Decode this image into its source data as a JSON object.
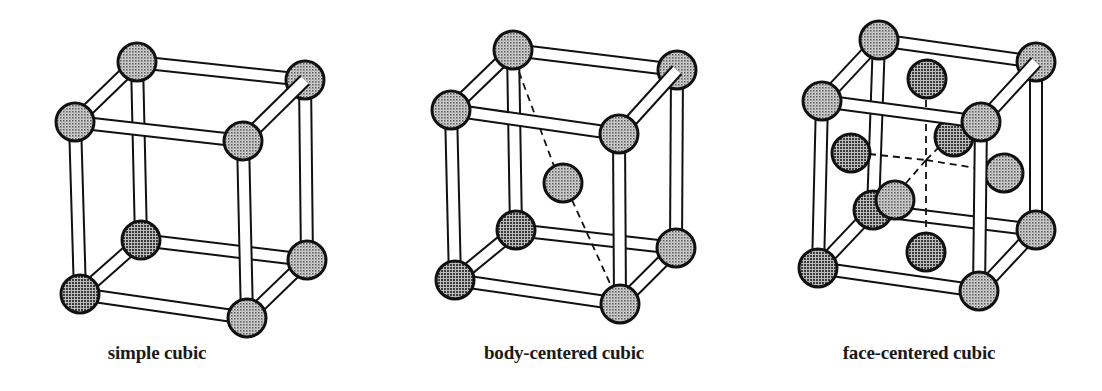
{
  "figure": {
    "colors": {
      "background": "#ffffff",
      "outline": "#111111",
      "atom_fill": "#bdbdbd",
      "atom_dot": "#444444",
      "rod_fill": "#ffffff"
    },
    "cells": [
      {
        "id": "simple-cubic",
        "label": "simple cubic",
        "label_x": 157,
        "atom_radius": 19,
        "rod_width": 11,
        "corners": {
          "TBL": [
            137,
            62
          ],
          "TBR": [
            305,
            80
          ],
          "TFL": [
            75,
            122
          ],
          "TFR": [
            243,
            141
          ],
          "BBL": [
            141,
            240
          ],
          "BBR": [
            307,
            260
          ],
          "BFL": [
            80,
            294
          ],
          "BFR": [
            247,
            318
          ]
        },
        "extra_atoms": [],
        "dashes": []
      },
      {
        "id": "body-centered-cubic",
        "label": "body-centered cubic",
        "label_x": 564,
        "atom_radius": 19,
        "rod_width": 11,
        "corners": {
          "TBL": [
            513,
            50
          ],
          "TBR": [
            677,
            70
          ],
          "TFL": [
            451,
            110
          ],
          "TFR": [
            619,
            134
          ],
          "BBL": [
            516,
            230
          ],
          "BBR": [
            676,
            248
          ],
          "BFL": [
            455,
            280
          ],
          "BFR": [
            620,
            304
          ]
        },
        "extra_atoms": [
          {
            "name": "body-center-atom",
            "pos": [
              563,
              183
            ],
            "layer": "middle"
          }
        ],
        "dashes": [
          [
            [
              519,
              72
            ],
            [
              554,
              166
            ]
          ],
          [
            [
              572,
              200
            ],
            [
              613,
              290
            ]
          ]
        ]
      },
      {
        "id": "face-centered-cubic",
        "label": "face-centered cubic",
        "label_x": 919,
        "atom_radius": 19,
        "rod_width": 11,
        "corners": {
          "TBL": [
            879,
            40
          ],
          "TBR": [
            1036,
            62
          ],
          "TFL": [
            822,
            101
          ],
          "TFR": [
            981,
            122
          ],
          "BBL": [
            873,
            210
          ],
          "BBR": [
            1036,
            230
          ],
          "BFL": [
            818,
            268
          ],
          "BFR": [
            979,
            291
          ]
        },
        "extra_atoms": [
          {
            "name": "top-face-atom",
            "pos": [
              927,
              79
            ],
            "layer": "back"
          },
          {
            "name": "back-face-atom",
            "pos": [
              954,
              137
            ],
            "layer": "back"
          },
          {
            "name": "left-face-atom",
            "pos": [
              851,
              153
            ],
            "layer": "back"
          },
          {
            "name": "right-face-atom",
            "pos": [
              1004,
              173
            ],
            "layer": "front"
          },
          {
            "name": "bottom-face-atom",
            "pos": [
              926,
              252
            ],
            "layer": "back"
          },
          {
            "name": "front-face-atom",
            "pos": [
              895,
              200
            ],
            "layer": "front"
          }
        ],
        "dashes": [
          [
            [
              869,
              154
            ],
            [
              926,
              160
            ]
          ],
          [
            [
              926,
              160
            ],
            [
              988,
              170
            ]
          ],
          [
            [
              926,
              100
            ],
            [
              926,
              233
            ]
          ],
          [
            [
              926,
              160
            ],
            [
              940,
              146
            ]
          ],
          [
            [
              926,
              160
            ],
            [
              906,
              183
            ]
          ]
        ]
      }
    ]
  }
}
